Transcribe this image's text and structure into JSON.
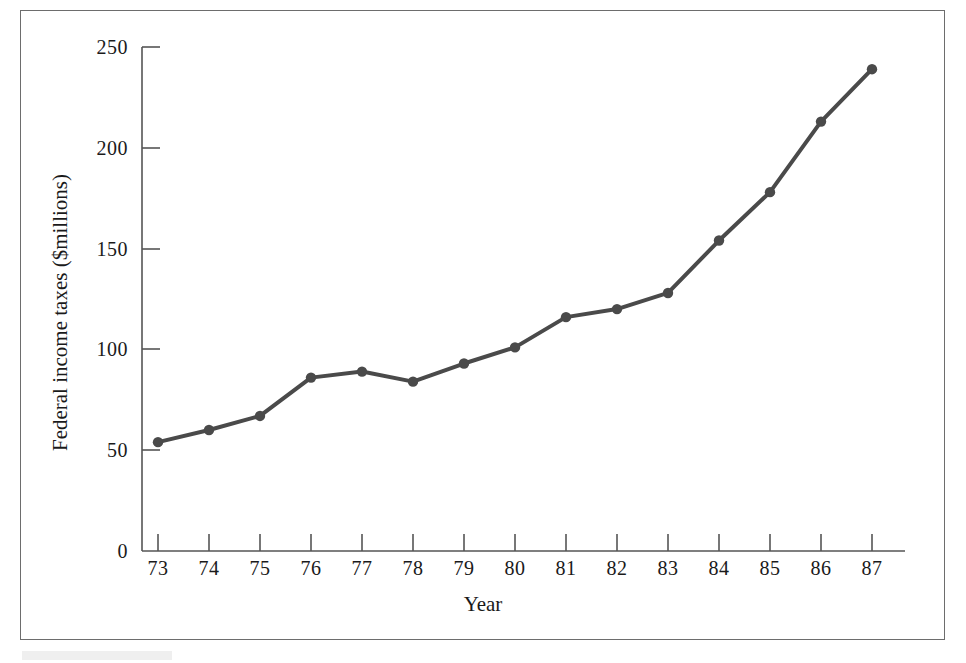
{
  "chart_data": {
    "type": "line",
    "title": "",
    "subtitle": "",
    "xlabel": "Year",
    "ylabel": "Federal income taxes ($millions)",
    "categories": [
      "73",
      "74",
      "75",
      "76",
      "77",
      "78",
      "79",
      "80",
      "81",
      "82",
      "83",
      "84",
      "85",
      "86",
      "87"
    ],
    "x": [
      1973,
      1974,
      1975,
      1976,
      1977,
      1978,
      1979,
      1980,
      1981,
      1982,
      1983,
      1984,
      1985,
      1986,
      1987
    ],
    "values": [
      54,
      60,
      67,
      86,
      89,
      84,
      93,
      101,
      116,
      120,
      128,
      154,
      178,
      213,
      239
    ],
    "series": [
      {
        "name": "Federal income taxes",
        "values": [
          54,
          60,
          67,
          86,
          89,
          84,
          93,
          101,
          116,
          120,
          128,
          154,
          178,
          213,
          239
        ]
      }
    ],
    "ylim": [
      0,
      250
    ],
    "yticks": [
      0,
      50,
      100,
      150,
      200,
      250
    ],
    "ytick_labels": [
      "0",
      "50",
      "100",
      "150",
      "200",
      "250"
    ],
    "xtick_labels": [
      "73",
      "74",
      "75",
      "76",
      "77",
      "78",
      "79",
      "80",
      "81",
      "82",
      "83",
      "84",
      "85",
      "86",
      "87"
    ],
    "grid": false,
    "legend": false,
    "legend_position": "none",
    "markers": true,
    "marker_shape": "circle",
    "line_color": "#4a4a4a",
    "marker_color": "#4a4a4a",
    "axis_color": "#555555",
    "frame_color": "#6d6d6d",
    "background_color": "#ffffff"
  },
  "figure": {
    "y_axis_title": "Federal income taxes ($millions)",
    "x_axis_title": "Year"
  }
}
